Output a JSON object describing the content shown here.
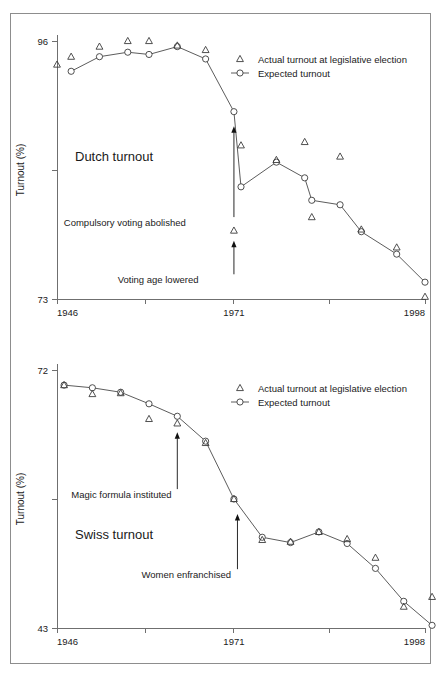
{
  "figure": {
    "background_color": "#ffffff",
    "frame_color": "#8d8d8d",
    "axis_color": "#6f6f6f",
    "marker_color": "#3c3c3c",
    "line_color": "#4a4a4a"
  },
  "legend": {
    "actual_label": "Actual turnout at legislative election",
    "expected_label": "Expected turnout",
    "actual_symbol": "triangle-outline-icon",
    "expected_symbol": "circle-outline-line-icon",
    "position": "top-right"
  },
  "chart_data": [
    {
      "type": "line",
      "panel_id": "dutch",
      "title": "Dutch turnout",
      "xlabel": "",
      "ylabel": "Turnout (%)",
      "xlim": [
        1946,
        1998
      ],
      "ylim": [
        73,
        96
      ],
      "grid": false,
      "xticks": [
        1946,
        1958.5,
        1971,
        1984.5,
        1998
      ],
      "xticklabels": [
        "1946",
        "",
        "1971",
        "",
        "1998"
      ],
      "yticks": [
        73,
        84.5,
        96
      ],
      "yticklabels": [
        "73",
        "",
        "96"
      ],
      "legend_position": "top-right",
      "series": [
        {
          "name": "Expected turnout",
          "marker": "circle",
          "connected": true,
          "x": [
            1948,
            1952,
            1956,
            1959,
            1963,
            1967,
            1971,
            1972,
            1977,
            1981,
            1982,
            1986,
            1989,
            1994,
            1998
          ],
          "y": [
            93.3,
            94.6,
            95.0,
            94.8,
            95.5,
            94.4,
            89.7,
            83.0,
            85.2,
            83.8,
            81.8,
            81.4,
            79.0,
            77.0,
            74.5
          ]
        },
        {
          "name": "Actual turnout at legislative election",
          "marker": "triangle",
          "connected": false,
          "x": [
            1946,
            1948,
            1952,
            1956,
            1959,
            1963,
            1967,
            1971,
            1972,
            1977,
            1981,
            1982,
            1986,
            1989,
            1994,
            1998
          ],
          "y": [
            93.9,
            94.6,
            95.5,
            96.0,
            96.0,
            95.6,
            95.2,
            79.1,
            86.7,
            85.4,
            87.0,
            80.3,
            85.7,
            79.2,
            77.6,
            73.2
          ]
        }
      ],
      "annotations": [
        {
          "label": "Compulsory voting abolished",
          "target_x": 1971,
          "target_y": 88.4,
          "label_x": 1964.2,
          "label_y": 79.5,
          "anchor": "end"
        },
        {
          "label": "Voting age lowered",
          "target_x": 1971,
          "target_y": 78.2,
          "label_x": 1966.0,
          "label_y": 74.4,
          "anchor": "end"
        }
      ]
    },
    {
      "type": "line",
      "panel_id": "swiss",
      "title": "Swiss turnout",
      "xlabel": "",
      "ylabel": "Turnout (%)",
      "xlim": [
        1946,
        1998
      ],
      "ylim": [
        43,
        72
      ],
      "grid": false,
      "xticks": [
        1946,
        1958.5,
        1971,
        1984.5,
        1998
      ],
      "xticklabels": [
        "1946",
        "",
        "1971",
        "",
        "1998"
      ],
      "yticks": [
        43,
        57.5,
        72
      ],
      "yticklabels": [
        "43",
        "",
        "72"
      ],
      "legend_position": "top-right",
      "series": [
        {
          "name": "Expected turnout",
          "marker": "circle",
          "connected": true,
          "x": [
            1947,
            1951,
            1955,
            1959,
            1963,
            1967,
            1971,
            1975,
            1979,
            1983,
            1987,
            1991,
            1995,
            1999
          ],
          "y": [
            70.3,
            70.0,
            69.5,
            68.2,
            66.8,
            64.0,
            57.5,
            53.2,
            52.6,
            53.8,
            52.5,
            49.7,
            46.0,
            43.3
          ]
        },
        {
          "name": "Actual turnout at legislative election",
          "marker": "triangle",
          "connected": false,
          "x": [
            1947,
            1951,
            1955,
            1959,
            1963,
            1967,
            1971,
            1975,
            1979,
            1983,
            1987,
            1991,
            1995,
            1999
          ],
          "y": [
            70.3,
            69.3,
            69.4,
            66.5,
            66.0,
            63.8,
            57.5,
            52.9,
            52.7,
            53.8,
            53.0,
            50.9,
            45.4,
            46.5
          ]
        }
      ],
      "annotations": [
        {
          "label": "Magic formula instituted",
          "target_x": 1963,
          "target_y": 65.0,
          "label_x": 1962.2,
          "label_y": 57.6,
          "anchor": "end"
        },
        {
          "label": "Women enfranchised",
          "target_x": 1971.5,
          "target_y": 55.8,
          "label_x": 1970.6,
          "label_y": 48.6,
          "anchor": "end"
        }
      ]
    }
  ]
}
